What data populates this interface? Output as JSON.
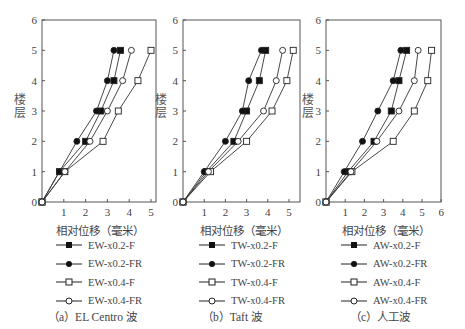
{
  "chart_data": [
    {
      "type": "line",
      "panel": "a",
      "caption": "（a）EL Centro 波",
      "xlabel": "相对位移（毫米）",
      "ylabel": "楼层",
      "xlim": [
        0,
        5.2
      ],
      "ylim": [
        0,
        6
      ],
      "xticks": [
        1,
        2,
        3,
        4,
        5
      ],
      "yticks": [
        0,
        1,
        2,
        3,
        4,
        5,
        6
      ],
      "y": [
        0,
        1,
        2,
        3,
        4,
        5
      ],
      "series": [
        {
          "name": "EW-x0.2-F",
          "marker": "filled-square",
          "x": [
            0,
            0.8,
            2.0,
            2.7,
            3.3,
            3.6
          ]
        },
        {
          "name": "EW-x0.2-FR",
          "marker": "filled-circle",
          "x": [
            0,
            0.8,
            1.6,
            2.5,
            3.0,
            3.3
          ]
        },
        {
          "name": "EW-x0.4-F",
          "marker": "open-square",
          "x": [
            0,
            1.05,
            2.8,
            3.5,
            4.4,
            5.0
          ]
        },
        {
          "name": "EW-x0.4-FR",
          "marker": "open-circle",
          "x": [
            0,
            1.05,
            2.2,
            3.0,
            3.7,
            4.1
          ]
        }
      ]
    },
    {
      "type": "line",
      "panel": "b",
      "caption": "（b）Taft 波",
      "xlabel": "相对位移（毫米）",
      "ylabel": "楼层",
      "xlim": [
        0,
        5.5
      ],
      "ylim": [
        0,
        6
      ],
      "xticks": [
        1,
        2,
        3,
        4,
        5
      ],
      "yticks": [
        0,
        1,
        2,
        3,
        4,
        5,
        6
      ],
      "y": [
        0,
        1,
        2,
        3,
        4,
        5
      ],
      "series": [
        {
          "name": "TW-x0.2-F",
          "marker": "filled-square",
          "x": [
            0,
            1.1,
            2.4,
            3.0,
            3.6,
            3.9
          ]
        },
        {
          "name": "TW-x0.2-FR",
          "marker": "filled-circle",
          "x": [
            0,
            1.0,
            2.0,
            2.8,
            3.1,
            3.7
          ]
        },
        {
          "name": "TW-x0.4-F",
          "marker": "open-square",
          "x": [
            0,
            1.3,
            3.0,
            4.2,
            4.9,
            5.2
          ]
        },
        {
          "name": "TW-x0.4-FR",
          "marker": "open-circle",
          "x": [
            0,
            1.2,
            2.6,
            3.8,
            4.4,
            4.7
          ]
        }
      ]
    },
    {
      "type": "line",
      "panel": "c",
      "caption": "（c）人工波",
      "xlabel": "相对位移（毫米）",
      "ylabel": "楼层",
      "xlim": [
        0,
        6
      ],
      "ylim": [
        0,
        6
      ],
      "xticks": [
        1,
        2,
        3,
        4,
        5,
        6
      ],
      "yticks": [
        0,
        1,
        2,
        3,
        4,
        5,
        6
      ],
      "y": [
        0,
        1,
        2,
        3,
        4,
        5
      ],
      "series": [
        {
          "name": "AW-x0.2-F",
          "marker": "filled-square",
          "x": [
            0,
            1.15,
            2.5,
            3.4,
            3.8,
            4.2
          ]
        },
        {
          "name": "AW-x0.2-FR",
          "marker": "filled-circle",
          "x": [
            0,
            0.95,
            1.9,
            2.7,
            3.5,
            3.9
          ]
        },
        {
          "name": "AW-x0.4-F",
          "marker": "open-square",
          "x": [
            0,
            1.35,
            3.5,
            4.6,
            5.3,
            5.5
          ]
        },
        {
          "name": "AW-x0.4-FR",
          "marker": "open-circle",
          "x": [
            0,
            1.3,
            2.65,
            3.8,
            4.6,
            4.8
          ]
        }
      ]
    }
  ],
  "panels": [
    {
      "xlabel": "相对位移（毫米）",
      "ylabel_top": "楼",
      "ylabel_bottom": "层",
      "caption": "（a）EL Centro 波",
      "legend": [
        "EW-x0.2-F",
        "EW-x0.2-FR",
        "EW-x0.4-F",
        "EW-x0.4-FR"
      ]
    },
    {
      "xlabel": "相对位移（毫米）",
      "ylabel_top": "楼",
      "ylabel_bottom": "层",
      "caption": "（b）Taft 波",
      "legend": [
        "TW-x0.2-F",
        "TW-x0.2-FR",
        "TW-x0.4-F",
        "TW-x0.4-FR"
      ]
    },
    {
      "xlabel": "相对位移（毫米）",
      "ylabel_top": "楼",
      "ylabel_bottom": "层",
      "caption": "（c）人工波",
      "legend": [
        "AW-x0.2-F",
        "AW-x0.2-FR",
        "AW-x0.4-F",
        "AW-x0.4-FR"
      ]
    }
  ]
}
